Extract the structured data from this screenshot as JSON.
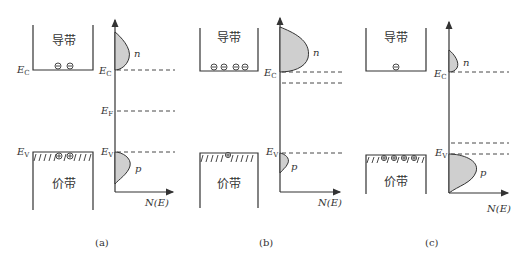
{
  "figure": {
    "panels": [
      {
        "id": "a",
        "caption": "(a)",
        "conduction_band_label": "导带",
        "valence_band_label": "价带",
        "ec_label": "E",
        "ec_sub": "C",
        "ev_label": "E",
        "ev_sub": "V",
        "ef_label": "E",
        "ef_sub": "F",
        "n_label": "n",
        "p_label": "p",
        "axis_label": "N(E)",
        "electrons": 2,
        "holes": 2,
        "description": "intrinsic: Fermi level mid-gap, equal n and p"
      },
      {
        "id": "b",
        "caption": "(b)",
        "conduction_band_label": "导带",
        "valence_band_label": "价带",
        "ec_label": "E",
        "ec_sub": "C",
        "ev_label": "E",
        "ev_sub": "V",
        "n_label": "n",
        "p_label": "p",
        "axis_label": "N(E)",
        "electrons": 4,
        "holes": 1,
        "description": "n-type: Fermi level near conduction band, large n"
      },
      {
        "id": "c",
        "caption": "(c)",
        "conduction_band_label": "导带",
        "valence_band_label": "价带",
        "ec_label": "E",
        "ec_sub": "C",
        "ev_label": "E",
        "ev_sub": "V",
        "n_label": "n",
        "p_label": "p",
        "axis_label": "N(E)",
        "electrons": 1,
        "holes": 4,
        "description": "p-type: Fermi level near valence band, large p"
      }
    ],
    "colors": {
      "line": "#333333",
      "fill": "#cfcfcf",
      "background": "#ffffff"
    }
  }
}
